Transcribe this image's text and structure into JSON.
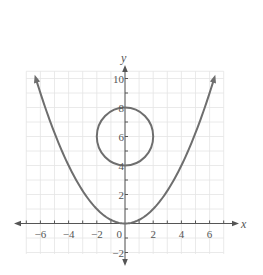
{
  "chart_data": {
    "type": "line",
    "title": "",
    "xlabel": "x",
    "ylabel": "y",
    "xlim": [
      -7,
      7
    ],
    "ylim": [
      -2,
      10.5
    ],
    "grid": true,
    "x_ticks": [
      -6,
      -4,
      -2,
      0,
      2,
      4,
      6
    ],
    "x_tick_labels": [
      "−6",
      "−4",
      "−2",
      "0",
      "2",
      "4",
      "6"
    ],
    "y_ticks": [
      -2,
      2,
      4,
      6,
      8,
      10
    ],
    "y_tick_labels": [
      "−2",
      "2",
      "4",
      "6",
      "8",
      "10"
    ],
    "series": [
      {
        "name": "parabola",
        "equation": "y = x^2/4",
        "x": [
          -6.3,
          -6,
          -4,
          -2,
          0,
          2,
          4,
          6,
          6.3
        ],
        "y": [
          9.92,
          9,
          4,
          1,
          0,
          1,
          4,
          9,
          9.92
        ],
        "arrows": "both ends"
      },
      {
        "name": "circle",
        "equation": "x^2 + (y - 6)^2 = 4",
        "center": [
          0,
          6
        ],
        "radius": 2
      }
    ],
    "colors": {
      "curve": "#6e6e6e",
      "axis": "#555555",
      "grid": "#e4e4e4"
    }
  }
}
